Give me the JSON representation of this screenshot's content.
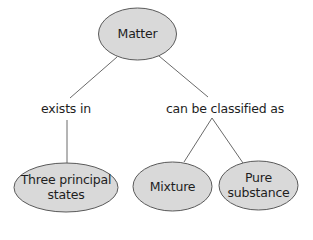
{
  "diagram": {
    "type": "concept-map",
    "colors": {
      "node_fill": "#d9d9d9",
      "node_stroke": "#5a5a5a",
      "edge_stroke": "#6a6a6a",
      "text": "#1e1e1e",
      "background": "#ffffff"
    },
    "nodes": {
      "matter": {
        "label": "Matter"
      },
      "states": {
        "line1": "Three principal",
        "line2": "states"
      },
      "mixture": {
        "label": "Mixture"
      },
      "pure": {
        "line1": "Pure",
        "line2": "substance"
      }
    },
    "edge_labels": {
      "exists_in": "exists in",
      "classified_as": "can be classified as"
    },
    "relations": [
      {
        "from": "Matter",
        "label": "exists in",
        "to": "Three principal states"
      },
      {
        "from": "Matter",
        "label": "can be classified as",
        "to": "Mixture"
      },
      {
        "from": "Matter",
        "label": "can be classified as",
        "to": "Pure substance"
      }
    ]
  }
}
